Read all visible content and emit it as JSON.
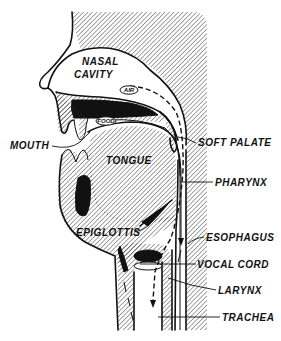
{
  "diagram": {
    "labels": {
      "nasal_cavity_line1": "NASAL",
      "nasal_cavity_line2": "CAVITY",
      "air": "AIR",
      "food": "FOOD",
      "mouth": "MOUTH",
      "tongue": "TONGUE",
      "soft_palate": "SOFT PALATE",
      "pharynx": "PHARYNX",
      "epiglottis": "EPIGLOTTIS",
      "esophagus": "ESOPHAGUS",
      "vocal_cord": "VOCAL CORD",
      "larynx": "LARYNX",
      "trachea": "TRACHEA"
    },
    "colors": {
      "ink": "#111111",
      "background": "#ffffff"
    }
  }
}
